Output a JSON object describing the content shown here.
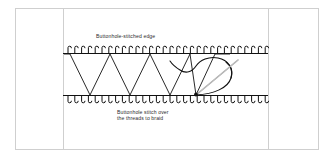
{
  "figure": {
    "background_color": "#ffffff",
    "frame": {
      "border_color": "#cfcfcf",
      "x": 15,
      "y": 8,
      "width": 304,
      "height": 142,
      "divider_left_x": 63,
      "divider_right_x": 268
    },
    "labels": {
      "top": "Buttonhole-stitched edge",
      "bottom_line1": "Buttonhole stitch over",
      "bottom_line2": "the threads to braid"
    },
    "label_color": "#2b2b2b",
    "stitch_color": "#111111",
    "needle_color": "#9a9a9a",
    "edges": {
      "top_edge_y": 53,
      "bottom_edge_y": 96,
      "edge_start_x": 63,
      "edge_end_x": 268,
      "stitch_count": 30,
      "stitch_height": 7
    },
    "zigzag": {
      "description": "laid threads zigzagging between the two buttonhole-stitched edges",
      "peaks_top_x": [
        70,
        110,
        150,
        190,
        230
      ],
      "valleys_bottom_x": [
        90,
        130,
        170,
        210
      ]
    },
    "needle": {
      "description": "needle passing through thread loop at working point",
      "entry_point_x": 196,
      "entry_point_y": 95,
      "tip_x": 236,
      "tip_y": 62
    },
    "loop": {
      "description": "working thread loop curving to the right of the needle"
    }
  }
}
